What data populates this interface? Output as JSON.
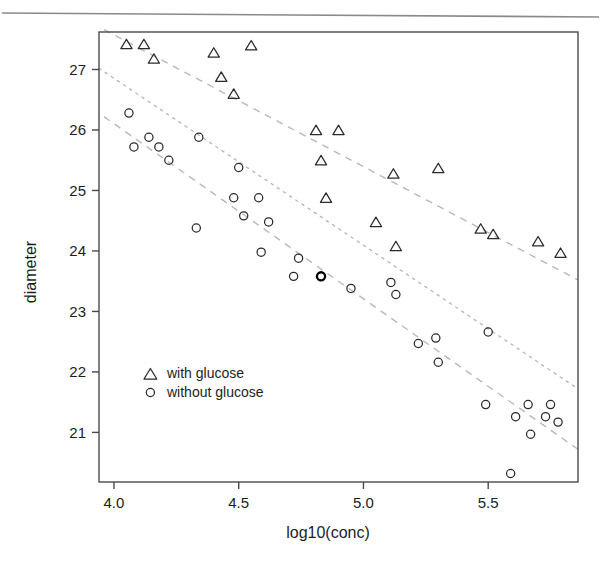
{
  "figure": {
    "background_color": "#ffffff",
    "scan_rule_color": "#8a8a8a",
    "frame_color": "#4a4a4a",
    "marker_color": "#2a2a2a",
    "trend_color": "#b9b9b9"
  },
  "axis": {
    "x_title": "log10(conc)",
    "y_title": "diameter",
    "x_ticks": [
      "4.0",
      "4.5",
      "5.0",
      "5.5"
    ],
    "y_ticks": [
      "21",
      "22",
      "23",
      "24",
      "25",
      "26",
      "27"
    ]
  },
  "legend": {
    "items": [
      {
        "marker": "triangle",
        "label": "with glucose"
      },
      {
        "marker": "circle",
        "label": "without glucose"
      }
    ]
  },
  "chart_data": {
    "type": "scatter",
    "title": "",
    "xlabel": "log10(conc)",
    "ylabel": "diameter",
    "xlim": [
      3.94,
      5.86
    ],
    "ylim": [
      20.18,
      27.62
    ],
    "x_ticks": [
      4.0,
      4.5,
      5.0,
      5.5
    ],
    "y_ticks": [
      21,
      22,
      23,
      24,
      25,
      26,
      27
    ],
    "grid": false,
    "legend_position": "lower-left-inside",
    "series": [
      {
        "name": "with glucose",
        "marker": "triangle",
        "points": [
          [
            4.05,
            27.42
          ],
          [
            4.12,
            27.42
          ],
          [
            4.16,
            27.18
          ],
          [
            4.4,
            27.28
          ],
          [
            4.43,
            26.88
          ],
          [
            4.48,
            26.6
          ],
          [
            4.55,
            27.4
          ],
          [
            4.81,
            26.0
          ],
          [
            4.83,
            25.5
          ],
          [
            4.9,
            26.0
          ],
          [
            4.85,
            24.88
          ],
          [
            5.05,
            24.48
          ],
          [
            5.12,
            25.28
          ],
          [
            5.13,
            24.08
          ],
          [
            5.3,
            25.37
          ],
          [
            5.47,
            24.37
          ],
          [
            5.52,
            24.28
          ],
          [
            5.7,
            24.16
          ],
          [
            5.79,
            23.97
          ]
        ]
      },
      {
        "name": "without glucose",
        "marker": "circle",
        "points": [
          [
            4.06,
            26.28
          ],
          [
            4.08,
            25.72
          ],
          [
            4.14,
            25.88
          ],
          [
            4.18,
            25.72
          ],
          [
            4.22,
            25.5
          ],
          [
            4.33,
            24.38
          ],
          [
            4.34,
            25.88
          ],
          [
            4.48,
            24.88
          ],
          [
            4.5,
            25.38
          ],
          [
            4.52,
            24.58
          ],
          [
            4.58,
            24.88
          ],
          [
            4.59,
            23.98
          ],
          [
            4.62,
            24.48
          ],
          [
            4.72,
            23.58
          ],
          [
            4.74,
            23.88
          ],
          [
            4.83,
            23.58
          ],
          [
            4.95,
            23.38
          ],
          [
            5.11,
            23.48
          ],
          [
            5.13,
            23.28
          ],
          [
            5.22,
            22.47
          ],
          [
            5.29,
            22.56
          ],
          [
            5.3,
            22.16
          ],
          [
            5.49,
            21.46
          ],
          [
            5.5,
            22.66
          ],
          [
            5.59,
            20.32
          ],
          [
            5.61,
            21.26
          ],
          [
            5.66,
            21.46
          ],
          [
            5.67,
            20.97
          ],
          [
            5.73,
            21.26
          ],
          [
            5.75,
            21.46
          ],
          [
            5.78,
            21.17
          ]
        ],
        "highlighted_point": [
          4.83,
          23.58
        ]
      }
    ],
    "trend_lines": [
      {
        "name": "with-glucose-fit",
        "style": "dashed",
        "x_start": 3.96,
        "y_start": 27.66,
        "x_end": 5.86,
        "y_end": 23.52
      },
      {
        "name": "middle-fit",
        "style": "dotted",
        "x_start": 3.94,
        "y_start": 27.02,
        "x_end": 5.86,
        "y_end": 21.72
      },
      {
        "name": "without-glucose-fit",
        "style": "dashed",
        "x_start": 3.96,
        "y_start": 26.22,
        "x_end": 5.86,
        "y_end": 20.72
      }
    ]
  }
}
